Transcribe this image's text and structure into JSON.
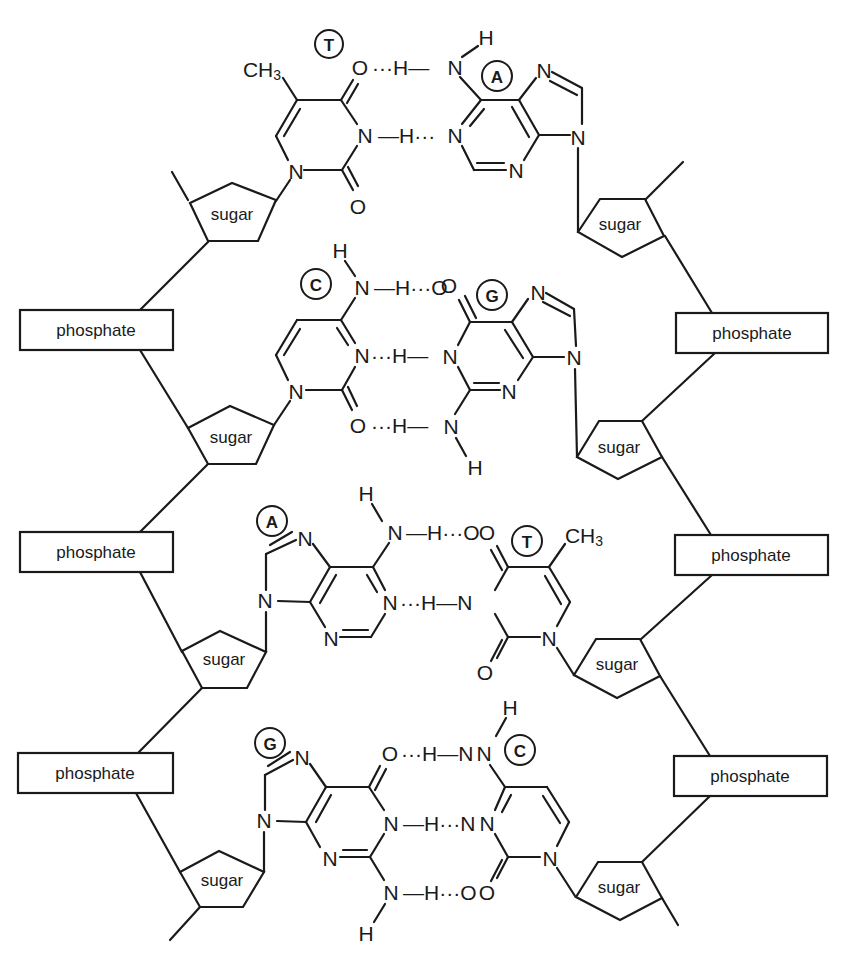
{
  "diagram": {
    "colors": {
      "ink": "#1a1a1a",
      "background": "#ffffff"
    },
    "backbone_labels": {
      "phosphate": "phosphate",
      "sugar": "sugar"
    },
    "left_strand": {
      "phosphates": [
        {
          "label": "phosphate",
          "x": 20,
          "y": 310,
          "w": 153,
          "h": 40
        },
        {
          "label": "phosphate",
          "x": 20,
          "y": 532,
          "w": 153,
          "h": 40
        },
        {
          "label": "phosphate",
          "x": 18,
          "y": 753,
          "w": 155,
          "h": 40
        }
      ],
      "sugars": [
        {
          "label": "sugar",
          "cx": 228,
          "cy": 212
        },
        {
          "label": "sugar",
          "cx": 230,
          "cy": 434
        },
        {
          "label": "sugar",
          "cx": 224,
          "cy": 658
        },
        {
          "label": "sugar",
          "cx": 220,
          "cy": 878
        }
      ]
    },
    "right_strand": {
      "phosphates": [
        {
          "label": "phosphate",
          "x": 676,
          "y": 313,
          "w": 152,
          "h": 40
        },
        {
          "label": "phosphate",
          "x": 675,
          "y": 535,
          "w": 153,
          "h": 40
        },
        {
          "label": "phosphate",
          "x": 674,
          "y": 756,
          "w": 153,
          "h": 40
        }
      ],
      "sugars": [
        {
          "label": "sugar",
          "cx": 620,
          "cy": 224
        },
        {
          "label": "sugar",
          "cx": 618,
          "cy": 445
        },
        {
          "label": "sugar",
          "cx": 618,
          "cy": 664
        },
        {
          "label": "sugar",
          "cx": 620,
          "cy": 886
        }
      ]
    },
    "base_pairs": [
      {
        "left": {
          "base": "T",
          "name": "thymine",
          "substituent": "CH3"
        },
        "right": {
          "base": "A",
          "name": "adenine"
        },
        "hydrogen_bonds": [
          "O···H—N",
          "N—H···N"
        ]
      },
      {
        "left": {
          "base": "C",
          "name": "cytosine"
        },
        "right": {
          "base": "G",
          "name": "guanine"
        },
        "hydrogen_bonds": [
          "N—H···O",
          "N···H—N",
          "O···H—N"
        ]
      },
      {
        "left": {
          "base": "A",
          "name": "adenine"
        },
        "right": {
          "base": "T",
          "name": "thymine",
          "substituent": "CH3"
        },
        "hydrogen_bonds": [
          "N—H···O",
          "N···H—N"
        ]
      },
      {
        "left": {
          "base": "G",
          "name": "guanine"
        },
        "right": {
          "base": "C",
          "name": "cytosine"
        },
        "hydrogen_bonds": [
          "O···H—N",
          "N—H···N",
          "N—H···O"
        ]
      }
    ],
    "atoms": {
      "N": "N",
      "O": "O",
      "H": "H",
      "C": "C",
      "CH": "CH",
      "three": "3"
    },
    "hbond_segments": {
      "dots_h_dash": "···H—",
      "dash_h_dots": "—H···"
    }
  }
}
